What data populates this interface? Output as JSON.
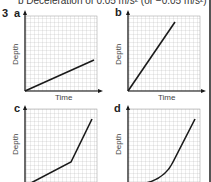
{
  "header": {
    "text": "b  Deceleration of 0.05 m/s²  (or −0.05 m/s²)"
  },
  "question_number": "3",
  "panels": [
    {
      "label": "a",
      "ylabel": "Depth",
      "xlabel": "Time"
    },
    {
      "label": "b",
      "ylabel": "Depth",
      "xlabel": "Time"
    },
    {
      "label": "c",
      "ylabel": "Depth",
      "xlabel": "Time"
    },
    {
      "label": "d",
      "ylabel": "Depth",
      "xlabel": "Time"
    }
  ],
  "colors": {
    "grid": "#b8b8b8",
    "line": "#1a1a1a",
    "axis": "#1a1a1a"
  }
}
